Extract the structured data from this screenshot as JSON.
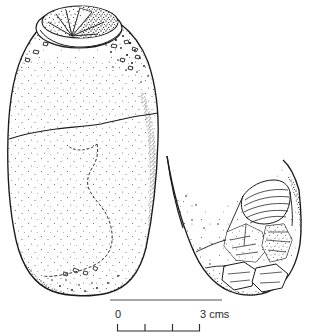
{
  "figure": {
    "kind": "archaeological-line-drawing",
    "technique": "stipple",
    "title": "",
    "caption": "",
    "background_color": "#ffffff",
    "ink_color": "#1a1a1a",
    "stipple_color": "#3a3a3a",
    "rule_color": "#8a8a8a",
    "objects": [
      {
        "id": "main-artefact",
        "name": "bullet-shaped stone artefact",
        "view": "profile",
        "features": [
          "oval striking platform at top",
          "radiating fracture lines on platform",
          "horizontal transverse fracture across mid body",
          "irregular vertical flake scar on lower body",
          "rounded base"
        ]
      },
      {
        "id": "fragment",
        "name": "detached basal fragment",
        "view": "profile",
        "features": [
          "steep concave left edge",
          "multiple flake scars",
          "striated ridged facet at upper right",
          "angular removals at base"
        ]
      }
    ]
  },
  "scale_bar": {
    "name": "scale-bar",
    "start_label": "0",
    "end_label": "3 cms",
    "unit": "cms",
    "min": 0,
    "max": 3,
    "tick_values": [
      0,
      1,
      2,
      3
    ],
    "tick_count": 4,
    "has_top_rule": true
  }
}
